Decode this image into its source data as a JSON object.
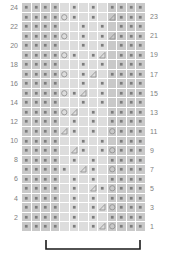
{
  "chart": {
    "kind": "knitting-chart",
    "title": "",
    "rows": 24,
    "cols": 13,
    "geometry": {
      "grid_left": 22,
      "grid_top": 3,
      "cell_w": 9.54,
      "cell_h": 9.54
    },
    "colors": {
      "background": "#ffffff",
      "cell_dark": "#c9c9c9",
      "cell_light": "#dddddd",
      "cell_mid": "#d4d4d4",
      "gridline": "#ffffff",
      "symbol": "#8a8a8a",
      "label": "#808080",
      "bracket": "#1a1a1a"
    },
    "row_numbers_left": [
      24,
      22,
      20,
      18,
      16,
      14,
      12,
      10,
      8,
      6,
      4,
      2
    ],
    "row_numbers_right": [
      23,
      21,
      19,
      17,
      15,
      13,
      11,
      9,
      7,
      5,
      3,
      1
    ],
    "legend_symbols": {
      "purl": "purl-dot",
      "yarnover": "yarn-over-circle",
      "decrease": "decrease-triangle",
      "knit": "blank-knit"
    },
    "repeat_bracket": {
      "label": "",
      "x_start": 46,
      "x_end": 140,
      "y": 240,
      "tick_height": 9
    },
    "cells": [
      {
        "row": 24,
        "shades": [
          "d",
          "d",
          "d",
          "d",
          "l",
          "l",
          "l",
          "l",
          "l",
          "d",
          "d",
          "d",
          "d"
        ],
        "syms": [
          "p",
          "p",
          "p",
          "p",
          "",
          "p",
          "",
          "p",
          "",
          "p",
          "p",
          "p",
          "p"
        ]
      },
      {
        "row": 23,
        "shades": [
          "d",
          "d",
          "d",
          "d",
          "l",
          "l",
          "l",
          "l",
          "l",
          "d",
          "d",
          "d",
          "d"
        ],
        "syms": [
          "p",
          "p",
          "p",
          "p",
          "o",
          "p",
          "",
          "p",
          "",
          "t",
          "p",
          "p",
          "p"
        ]
      },
      {
        "row": 22,
        "shades": [
          "d",
          "d",
          "d",
          "d",
          "l",
          "l",
          "l",
          "l",
          "l",
          "d",
          "d",
          "d",
          "d"
        ],
        "syms": [
          "p",
          "p",
          "p",
          "p",
          "",
          "",
          "p",
          "",
          "p",
          "",
          "p",
          "p",
          "p"
        ]
      },
      {
        "row": 21,
        "shades": [
          "d",
          "d",
          "d",
          "d",
          "l",
          "l",
          "l",
          "l",
          "l",
          "d",
          "d",
          "d",
          "d"
        ],
        "syms": [
          "p",
          "p",
          "p",
          "p",
          "o",
          "",
          "p",
          "",
          "p",
          "t",
          "p",
          "p",
          "p"
        ]
      },
      {
        "row": 20,
        "shades": [
          "d",
          "d",
          "d",
          "d",
          "l",
          "l",
          "l",
          "l",
          "l",
          "d",
          "d",
          "d",
          "d"
        ],
        "syms": [
          "p",
          "p",
          "p",
          "p",
          "",
          "",
          "p",
          "",
          "p",
          "",
          "p",
          "p",
          "p"
        ]
      },
      {
        "row": 19,
        "shades": [
          "d",
          "d",
          "d",
          "d",
          "l",
          "l",
          "l",
          "l",
          "l",
          "d",
          "d",
          "d",
          "d"
        ],
        "syms": [
          "p",
          "p",
          "p",
          "p",
          "o",
          "p",
          "",
          "p",
          "t",
          "",
          "p",
          "p",
          "p"
        ]
      },
      {
        "row": 18,
        "shades": [
          "d",
          "d",
          "d",
          "d",
          "l",
          "l",
          "l",
          "l",
          "l",
          "d",
          "d",
          "d",
          "d"
        ],
        "syms": [
          "p",
          "p",
          "p",
          "p",
          "",
          "",
          "p",
          "",
          "p",
          "",
          "p",
          "p",
          "p"
        ]
      },
      {
        "row": 17,
        "shades": [
          "d",
          "d",
          "d",
          "d",
          "l",
          "l",
          "l",
          "l",
          "l",
          "d",
          "d",
          "d",
          "d"
        ],
        "syms": [
          "p",
          "p",
          "p",
          "p",
          "o",
          "",
          "p",
          "t",
          "",
          "p",
          "p",
          "p",
          "p"
        ]
      },
      {
        "row": 16,
        "shades": [
          "d",
          "d",
          "d",
          "d",
          "l",
          "l",
          "l",
          "l",
          "l",
          "d",
          "d",
          "d",
          "d"
        ],
        "syms": [
          "p",
          "p",
          "p",
          "p",
          "",
          "",
          "p",
          "",
          "p",
          "",
          "p",
          "p",
          "p"
        ]
      },
      {
        "row": 15,
        "shades": [
          "d",
          "d",
          "d",
          "d",
          "l",
          "l",
          "l",
          "l",
          "l",
          "d",
          "d",
          "d",
          "d"
        ],
        "syms": [
          "p",
          "p",
          "p",
          "p",
          "o",
          "p",
          "t",
          "",
          "p",
          "",
          "p",
          "p",
          "p"
        ]
      },
      {
        "row": 14,
        "shades": [
          "d",
          "d",
          "d",
          "d",
          "l",
          "l",
          "l",
          "l",
          "l",
          "d",
          "d",
          "d",
          "d"
        ],
        "syms": [
          "p",
          "p",
          "p",
          "p",
          "",
          "",
          "p",
          "",
          "p",
          "",
          "p",
          "p",
          "p"
        ]
      },
      {
        "row": 13,
        "shades": [
          "d",
          "d",
          "d",
          "d",
          "l",
          "l",
          "l",
          "l",
          "l",
          "d",
          "d",
          "d",
          "d"
        ],
        "syms": [
          "p",
          "p",
          "p",
          "p",
          "o",
          "t",
          "",
          "p",
          "",
          "p",
          "p",
          "p",
          "p"
        ]
      },
      {
        "row": 12,
        "shades": [
          "d",
          "d",
          "d",
          "d",
          "l",
          "l",
          "l",
          "l",
          "l",
          "d",
          "d",
          "d",
          "d"
        ],
        "syms": [
          "p",
          "p",
          "p",
          "p",
          "",
          "p",
          "",
          "p",
          "",
          "p",
          "p",
          "p",
          "p"
        ]
      },
      {
        "row": 11,
        "shades": [
          "d",
          "d",
          "d",
          "d",
          "l",
          "l",
          "l",
          "l",
          "l",
          "d",
          "d",
          "d",
          "d"
        ],
        "syms": [
          "p",
          "p",
          "p",
          "p",
          "t",
          "p",
          "",
          "p",
          "",
          "o",
          "p",
          "p",
          "p"
        ]
      },
      {
        "row": 10,
        "shades": [
          "d",
          "d",
          "d",
          "d",
          "l",
          "l",
          "l",
          "l",
          "l",
          "d",
          "d",
          "d",
          "d"
        ],
        "syms": [
          "p",
          "p",
          "p",
          "p",
          "",
          "",
          "p",
          "",
          "p",
          "",
          "p",
          "p",
          "p"
        ]
      },
      {
        "row": 9,
        "shades": [
          "d",
          "d",
          "d",
          "d",
          "l",
          "l",
          "l",
          "l",
          "l",
          "d",
          "d",
          "d",
          "d"
        ],
        "syms": [
          "p",
          "p",
          "p",
          "p",
          "",
          "t",
          "p",
          "",
          "p",
          "o",
          "p",
          "p",
          "p"
        ]
      },
      {
        "row": 8,
        "shades": [
          "d",
          "d",
          "d",
          "d",
          "l",
          "l",
          "l",
          "l",
          "l",
          "d",
          "d",
          "d",
          "d"
        ],
        "syms": [
          "p",
          "p",
          "p",
          "p",
          "",
          "p",
          "",
          "p",
          "",
          "p",
          "p",
          "p",
          "p"
        ]
      },
      {
        "row": 7,
        "shades": [
          "d",
          "d",
          "d",
          "d",
          "l",
          "l",
          "l",
          "l",
          "l",
          "d",
          "d",
          "d",
          "d"
        ],
        "syms": [
          "p",
          "p",
          "p",
          "p",
          "p",
          "",
          "t",
          "p",
          "",
          "o",
          "p",
          "p",
          "p"
        ]
      },
      {
        "row": 6,
        "shades": [
          "d",
          "d",
          "d",
          "d",
          "l",
          "l",
          "l",
          "l",
          "l",
          "d",
          "d",
          "d",
          "d"
        ],
        "syms": [
          "p",
          "p",
          "p",
          "p",
          "",
          "p",
          "",
          "p",
          "",
          "p",
          "p",
          "p",
          "p"
        ]
      },
      {
        "row": 5,
        "shades": [
          "d",
          "d",
          "d",
          "d",
          "l",
          "l",
          "l",
          "l",
          "l",
          "d",
          "d",
          "d",
          "d"
        ],
        "syms": [
          "p",
          "p",
          "p",
          "p",
          "",
          "p",
          "",
          "t",
          "p",
          "o",
          "p",
          "p",
          "p"
        ]
      },
      {
        "row": 4,
        "shades": [
          "d",
          "d",
          "d",
          "d",
          "l",
          "l",
          "l",
          "l",
          "l",
          "d",
          "d",
          "d",
          "d"
        ],
        "syms": [
          "p",
          "p",
          "p",
          "p",
          "",
          "p",
          "",
          "p",
          "",
          "p",
          "p",
          "p",
          "p"
        ]
      },
      {
        "row": 3,
        "shades": [
          "d",
          "d",
          "d",
          "d",
          "l",
          "l",
          "l",
          "l",
          "l",
          "d",
          "d",
          "d",
          "d"
        ],
        "syms": [
          "p",
          "p",
          "p",
          "p",
          "",
          "p",
          "",
          "p",
          "t",
          "o",
          "p",
          "p",
          "p"
        ]
      },
      {
        "row": 2,
        "shades": [
          "d",
          "d",
          "d",
          "d",
          "l",
          "l",
          "l",
          "l",
          "l",
          "d",
          "d",
          "d",
          "d"
        ],
        "syms": [
          "p",
          "p",
          "p",
          "p",
          "",
          "p",
          "",
          "p",
          "",
          "p",
          "p",
          "p",
          "p"
        ]
      },
      {
        "row": 1,
        "shades": [
          "d",
          "d",
          "d",
          "d",
          "l",
          "l",
          "l",
          "l",
          "l",
          "d",
          "d",
          "d",
          "d"
        ],
        "syms": [
          "p",
          "p",
          "p",
          "p",
          "",
          "p",
          "",
          "p",
          "t",
          "o",
          "p",
          "p",
          "p"
        ]
      }
    ]
  }
}
